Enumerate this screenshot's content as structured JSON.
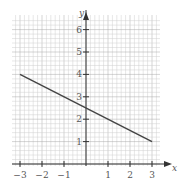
{
  "chart_data": {
    "type": "line",
    "title": "",
    "xlabel": "x",
    "ylabel": "y",
    "xlim": [
      -3.4,
      3.4
    ],
    "ylim": [
      -0.3,
      6.5
    ],
    "grid": true,
    "minor_grid_step": 0.2,
    "x_ticks": [
      -3,
      -2,
      -1,
      1,
      2,
      3
    ],
    "x_tick_labels": [
      "−3",
      "−2",
      "−1",
      "1",
      "2",
      "3"
    ],
    "y_ticks": [
      1,
      2,
      3,
      4,
      5,
      6
    ],
    "y_tick_labels": [
      "1",
      "2",
      "3",
      "4",
      "5",
      "6"
    ],
    "series": [
      {
        "name": "line",
        "x": [
          -3,
          3
        ],
        "y": [
          4,
          1
        ],
        "color": "#444444"
      }
    ],
    "equation_implied": "y = -0.5x + 2.5"
  },
  "labels": {
    "x_axis": "x",
    "y_axis": "y"
  }
}
